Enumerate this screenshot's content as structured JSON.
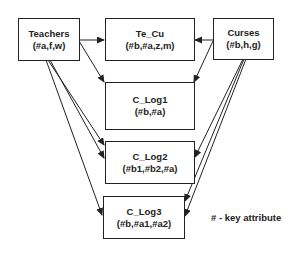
{
  "diagram": {
    "type": "entity-relationship",
    "entities": [
      {
        "id": "teachers",
        "name": "Teachers",
        "attributes": "(#a,f,w)"
      },
      {
        "id": "te_cu",
        "name": "Te_Cu",
        "attributes": "(#b,#a,z,m)"
      },
      {
        "id": "curses",
        "name": "Curses",
        "attributes": "(#b,h,g)"
      },
      {
        "id": "c_log1",
        "name": "C_Log1",
        "attributes": "(#b,#a)"
      },
      {
        "id": "c_log2",
        "name": "C_Log2",
        "attributes": "(#b1,#b2,#a)"
      },
      {
        "id": "c_log3",
        "name": "C_Log3",
        "attributes": "(#b,#a1,#a2)"
      }
    ],
    "edges": [
      {
        "from": "teachers",
        "to": "te_cu"
      },
      {
        "from": "teachers",
        "to": "c_log1"
      },
      {
        "from": "teachers",
        "to": "c_log2"
      },
      {
        "from": "teachers",
        "to": "c_log2"
      },
      {
        "from": "teachers",
        "to": "c_log3"
      },
      {
        "from": "curses",
        "to": "te_cu"
      },
      {
        "from": "curses",
        "to": "c_log1"
      },
      {
        "from": "curses",
        "to": "c_log2"
      },
      {
        "from": "curses",
        "to": "c_log3"
      },
      {
        "from": "curses",
        "to": "c_log3"
      }
    ],
    "legend": "# - key attribute",
    "colors": {
      "line": "#222222",
      "background": "#ffffff"
    }
  }
}
